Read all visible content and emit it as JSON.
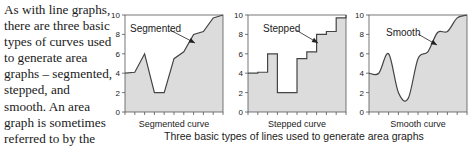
{
  "body_text": {
    "lines": [
      "As with line graphs,",
      "there are three basic",
      "types of curves used",
      "to generate area",
      "graphs – segmented,",
      "stepped, and",
      "smooth. An area",
      "graph is sometimes",
      "referred to by the"
    ]
  },
  "caption": "Three basic types of lines used to generate area graphs",
  "colors": {
    "fill": "#dcdcdc",
    "line": "#444444",
    "axis": "#555555"
  },
  "chart_data": [
    {
      "type": "area",
      "title": "Segmented",
      "annotation": "Segmented",
      "xlabel": "Segmented curve",
      "ylabel": "",
      "ylim": [
        0,
        10
      ],
      "yticks": [
        0,
        2,
        4,
        6,
        8,
        10
      ],
      "x": [
        0,
        1,
        2,
        3,
        4,
        5,
        6,
        7,
        8,
        9,
        10
      ],
      "values": [
        4,
        4.1,
        6,
        2,
        2,
        5.5,
        6.2,
        8,
        8.3,
        9.7,
        10
      ]
    },
    {
      "type": "area",
      "title": "Stepped",
      "annotation": "Stepped",
      "xlabel": "Stepped curve",
      "ylabel": "",
      "ylim": [
        0,
        10
      ],
      "yticks": [
        0,
        2,
        4,
        6,
        8,
        10
      ],
      "x": [
        0,
        1,
        2,
        3,
        4,
        5,
        6,
        7,
        8,
        9,
        10
      ],
      "values": [
        4,
        4.1,
        6,
        2,
        2,
        5.5,
        6.2,
        8,
        8.3,
        9.7,
        10
      ]
    },
    {
      "type": "area",
      "title": "Smooth",
      "annotation": "Smooth",
      "xlabel": "Smooth curve",
      "ylabel": "",
      "ylim": [
        0,
        10
      ],
      "yticks": [
        0,
        2,
        4,
        6,
        8,
        10
      ],
      "x": [
        0,
        1,
        2,
        3,
        4,
        5,
        6,
        7,
        8,
        9,
        10
      ],
      "values": [
        4,
        4,
        6,
        2,
        1.4,
        5.5,
        6.2,
        8.2,
        8.3,
        9.7,
        10
      ]
    }
  ]
}
